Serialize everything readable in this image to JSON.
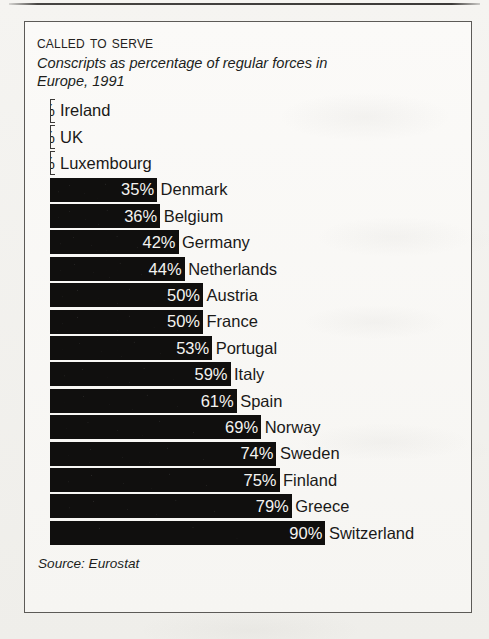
{
  "page": {
    "background_color": "#f2f1ee",
    "top_rule_color": "#282624"
  },
  "chart_frame": {
    "border_color": "#5c5a57",
    "background_color": "#fbfaf8"
  },
  "chart_data": {
    "type": "bar",
    "orientation": "horizontal",
    "title": "Called to Serve",
    "subtitle": "Conscripts as percentage of regular forces in Europe, 1991",
    "source": "Source: Eurostat",
    "xlabel": "",
    "ylabel": "",
    "xlim": [
      0,
      100
    ],
    "unit": "%",
    "grid": false,
    "legend": false,
    "bar_color": "#100f0e",
    "value_label_color": "#f4f3f0",
    "category_label_color": "#1a1918",
    "categories": [
      "Ireland",
      "UK",
      "Luxembourg",
      "Denmark",
      "Belgium",
      "Germany",
      "Netherlands",
      "Austria",
      "France",
      "Portugal",
      "Italy",
      "Spain",
      "Norway",
      "Sweden",
      "Finland",
      "Greece",
      "Switzerland"
    ],
    "values": [
      0,
      0,
      0,
      35,
      36,
      42,
      44,
      50,
      50,
      53,
      59,
      61,
      69,
      74,
      75,
      79,
      90
    ],
    "value_labels": [
      "0%",
      "0%",
      "0%",
      "35%",
      "36%",
      "42%",
      "44%",
      "50%",
      "50%",
      "53%",
      "59%",
      "61%",
      "69%",
      "74%",
      "75%",
      "79%",
      "90%"
    ],
    "bars": [
      {
        "label": "Ireland",
        "value": 0,
        "value_label": "0%"
      },
      {
        "label": "UK",
        "value": 0,
        "value_label": "0%"
      },
      {
        "label": "Luxembourg",
        "value": 0,
        "value_label": "0%"
      },
      {
        "label": "Denmark",
        "value": 35,
        "value_label": "35%"
      },
      {
        "label": "Belgium",
        "value": 36,
        "value_label": "36%"
      },
      {
        "label": "Germany",
        "value": 42,
        "value_label": "42%"
      },
      {
        "label": "Netherlands",
        "value": 44,
        "value_label": "44%"
      },
      {
        "label": "Austria",
        "value": 50,
        "value_label": "50%"
      },
      {
        "label": "France",
        "value": 50,
        "value_label": "50%"
      },
      {
        "label": "Portugal",
        "value": 53,
        "value_label": "53%"
      },
      {
        "label": "Italy",
        "value": 59,
        "value_label": "59%"
      },
      {
        "label": "Spain",
        "value": 61,
        "value_label": "61%"
      },
      {
        "label": "Norway",
        "value": 69,
        "value_label": "69%"
      },
      {
        "label": "Sweden",
        "value": 74,
        "value_label": "74%"
      },
      {
        "label": "Finland",
        "value": 75,
        "value_label": "75%"
      },
      {
        "label": "Greece",
        "value": 79,
        "value_label": "79%"
      },
      {
        "label": "Switzerland",
        "value": 90,
        "value_label": "90%"
      }
    ]
  }
}
